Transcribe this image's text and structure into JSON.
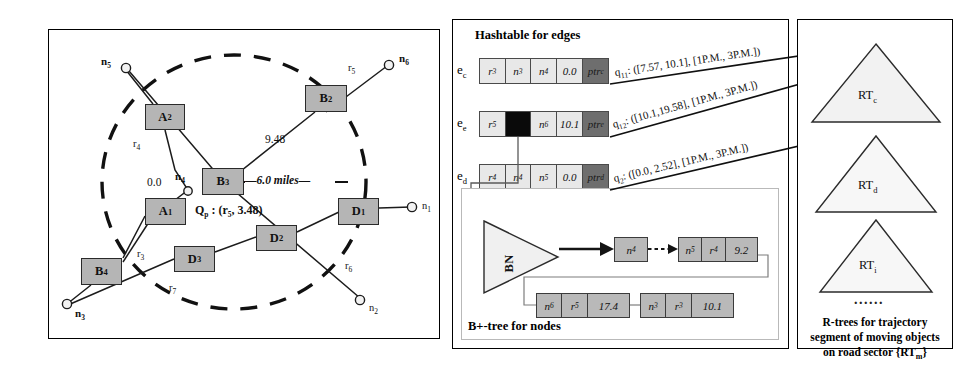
{
  "figure": {
    "background": "#ffffff",
    "ink": "#111111",
    "box_fill": "#b5b5b5",
    "cell_fill": "#e8e8e8",
    "ptr_fill": "#6e6e6e",
    "tree_fill": "#f2f2f2"
  },
  "left_panel": {
    "name": "road-network-map",
    "query_label": "Qₚ : (r₅, 3.48)",
    "radius_label": "—6.0 miles—",
    "distance_label": "9.48",
    "zero_label": "0.0",
    "segments": [
      {
        "id": "A2",
        "label": "A",
        "sub": "2",
        "x": 96,
        "y": 74,
        "w": 40,
        "h": 26
      },
      {
        "id": "B2",
        "label": "B",
        "sub": "2",
        "x": 256,
        "y": 55,
        "w": 42,
        "h": 27
      },
      {
        "id": "B3",
        "label": "B",
        "sub": "3",
        "x": 153,
        "y": 138,
        "w": 42,
        "h": 27
      },
      {
        "id": "A1",
        "label": "A",
        "sub": "1",
        "x": 96,
        "y": 168,
        "w": 41,
        "h": 27
      },
      {
        "id": "D1",
        "label": "D",
        "sub": "1",
        "x": 289,
        "y": 168,
        "w": 41,
        "h": 27
      },
      {
        "id": "D2",
        "label": "D",
        "sub": "2",
        "x": 207,
        "y": 195,
        "w": 41,
        "h": 26
      },
      {
        "id": "D3",
        "label": "D",
        "sub": "3",
        "x": 125,
        "y": 216,
        "w": 41,
        "h": 26
      },
      {
        "id": "B4",
        "label": "B",
        "sub": "4",
        "x": 32,
        "y": 228,
        "w": 41,
        "h": 27
      }
    ],
    "nodes": [
      {
        "id": "n5",
        "label": "n",
        "sub": "5",
        "cx": 77,
        "cy": 38,
        "lx": 52,
        "ly": 31,
        "bold": true
      },
      {
        "id": "n6",
        "label": "n",
        "sub": "6",
        "cx": 340,
        "cy": 35,
        "lx": 350,
        "ly": 28,
        "bold": true
      },
      {
        "id": "n4",
        "label": "n",
        "sub": "4",
        "cx": 139,
        "cy": 160,
        "lx": 126,
        "ly": 144,
        "bold": true
      },
      {
        "id": "n1",
        "label": "n",
        "sub": "1",
        "cx": 363,
        "cy": 177,
        "lx": 373,
        "ly": 170,
        "bold": false
      },
      {
        "id": "n2",
        "label": "n",
        "sub": "2",
        "cx": 311,
        "cy": 270,
        "lx": 320,
        "ly": 272,
        "bold": false
      },
      {
        "id": "n3",
        "label": "n",
        "sub": "3",
        "cx": 18,
        "cy": 274,
        "lx": 26,
        "ly": 277,
        "bold": true
      }
    ],
    "road_labels": [
      {
        "id": "r4",
        "label": "r",
        "sub": "4",
        "x": 84,
        "y": 112
      },
      {
        "id": "r5",
        "label": "r",
        "sub": "5",
        "x": 299,
        "y": 38
      },
      {
        "id": "r6",
        "label": "r",
        "sub": "6",
        "x": 296,
        "y": 235
      },
      {
        "id": "r3",
        "label": "r",
        "sub": "3",
        "x": 88,
        "y": 222
      },
      {
        "id": "r7",
        "label": "r",
        "sub": "7",
        "x": 120,
        "y": 255
      }
    ]
  },
  "mid_panel": {
    "name": "index-structures",
    "hashtable": {
      "title": "Hashtable for edges",
      "columns": [
        "road",
        "from_node",
        "to_node",
        "offset",
        "pointer"
      ],
      "rows": [
        {
          "key": "e",
          "key_sub": "c",
          "cells": [
            {
              "text": "r",
              "sub": "3",
              "type": "normal"
            },
            {
              "text": "n",
              "sub": "3",
              "type": "normal"
            },
            {
              "text": "n",
              "sub": "4",
              "type": "normal"
            },
            {
              "text": "0.0",
              "sub": "",
              "type": "normal"
            },
            {
              "text": "ptr",
              "sub": "c",
              "type": "ptr"
            }
          ]
        },
        {
          "key": "e",
          "key_sub": "e",
          "cells": [
            {
              "text": "r",
              "sub": "5",
              "type": "normal"
            },
            {
              "text": "",
              "sub": "",
              "type": "filled"
            },
            {
              "text": "n",
              "sub": "6",
              "type": "normal"
            },
            {
              "text": "10.1",
              "sub": "",
              "type": "normal"
            },
            {
              "text": "ptr",
              "sub": "e",
              "type": "ptr"
            }
          ]
        },
        {
          "key": "e",
          "key_sub": "d",
          "cells": [
            {
              "text": "r",
              "sub": "4",
              "type": "normal"
            },
            {
              "text": "n",
              "sub": "4",
              "type": "normal"
            },
            {
              "text": "n",
              "sub": "5",
              "type": "normal"
            },
            {
              "text": "0.0",
              "sub": "",
              "type": "normal"
            },
            {
              "text": "ptr",
              "sub": "d",
              "type": "ptr"
            }
          ]
        }
      ]
    },
    "queries": [
      {
        "id": "q11",
        "label": "q",
        "sub": "11",
        "text": ": ([7.57, 10.1], [1P.M., 3P.M.])"
      },
      {
        "id": "q12",
        "label": "q",
        "sub": "12",
        "text": ": ([10.1,19.58], [1P.M., 3P.M.])"
      },
      {
        "id": "q2",
        "label": "q",
        "sub": "2",
        "text": ": ([0.0, 2.52], [1P.M., 3P.M.])"
      }
    ],
    "btree": {
      "title": "B+-tree for nodes",
      "root_label": "BN",
      "leaf_head": {
        "text": "n",
        "sub": "4"
      },
      "leaves": [
        {
          "id": "leaf-1",
          "x": 112,
          "y": 48,
          "w": 92,
          "cells": [
            {
              "text": "n",
              "sub": "5",
              "w": 28
            },
            {
              "text": "r",
              "sub": "4",
              "w": 28
            },
            {
              "text": "9.2",
              "sub": "",
              "w": 36
            }
          ]
        },
        {
          "id": "leaf-2",
          "x": 74,
          "y": 100,
          "w": 94,
          "cells": [
            {
              "text": "n",
              "sub": "6",
              "w": 26
            },
            {
              "text": "r",
              "sub": "5",
              "w": 26
            },
            {
              "text": "17.4",
              "sub": "",
              "w": 42
            }
          ]
        },
        {
          "id": "leaf-3",
          "x": 178,
          "y": 100,
          "w": 94,
          "cells": [
            {
              "text": "n",
              "sub": "3",
              "w": 26
            },
            {
              "text": "r",
              "sub": "3",
              "w": 26
            },
            {
              "text": "10.1",
              "sub": "",
              "w": 42
            }
          ]
        }
      ]
    }
  },
  "right_panel": {
    "name": "rtree-forest",
    "trees": [
      {
        "id": "RTc",
        "label": "RT",
        "sub": "c",
        "cx": 78,
        "top": 24,
        "half": 64,
        "h": 78
      },
      {
        "id": "RTd",
        "label": "RT",
        "sub": "d",
        "cx": 78,
        "top": 116,
        "half": 60,
        "h": 76
      },
      {
        "id": "RTi",
        "label": "RT",
        "sub": "i",
        "cx": 78,
        "top": 200,
        "half": 56,
        "h": 72
      }
    ],
    "ellipsis": "......",
    "caption_lines": [
      "R-trees for trajectory",
      "segment of moving objects",
      "on road sector {RT"
    ],
    "caption_sub": "m",
    "caption_tail": "}"
  }
}
